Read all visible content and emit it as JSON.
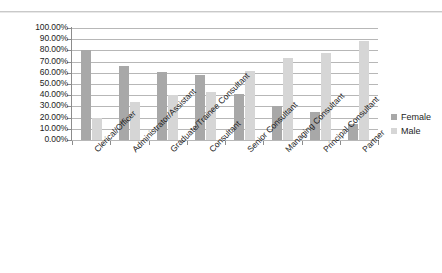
{
  "chart_data": {
    "type": "bar",
    "title": "",
    "subtitle": "",
    "xlabel": "",
    "ylabel": "",
    "ylim": [
      0,
      100
    ],
    "ytick_step": 10,
    "grid": true,
    "grid_axis": "y",
    "legend_position": "right",
    "value_format": "percent",
    "categories": [
      "Clerical/Officer",
      "Administrator/Assistant",
      "Graduate/Trainee Consultant",
      "Consultant",
      "Senior Consultant",
      "Managing Consultant",
      "Principal Consultant",
      "Partner"
    ],
    "ytick_labels": [
      "0.00%",
      "10.00%",
      "20.00%",
      "30.00%",
      "40.00%",
      "50.00%",
      "60.00%",
      "70.00%",
      "80.00%",
      "90.00%",
      "100.00%"
    ],
    "series": [
      {
        "name": "Female",
        "color": "#a8a8a8",
        "values": [
          80,
          66,
          61,
          58,
          41,
          30,
          25,
          14
        ]
      },
      {
        "name": "Male",
        "color": "#d6d6d6",
        "values": [
          20,
          34,
          40,
          43,
          62,
          73,
          78,
          88
        ]
      }
    ]
  },
  "legend": {
    "items": [
      {
        "label": "Female",
        "swatch_class": "female"
      },
      {
        "label": "Male",
        "swatch_class": "male"
      }
    ]
  },
  "colors": {
    "female_bar": "#a8a8a8",
    "male_bar": "#d6d6d6",
    "gridline": "#b7b7b7",
    "axis": "#5a5a5a",
    "text": "#1d1d1d",
    "background": "#ffffff"
  }
}
